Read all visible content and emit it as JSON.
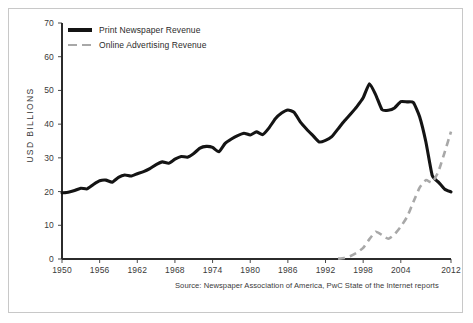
{
  "chart_data": {
    "type": "line",
    "title": "",
    "subtitle": "",
    "xlabel": "",
    "ylabel": "USD BILLIONS",
    "xlim": [
      1950,
      2012
    ],
    "ylim": [
      0,
      70
    ],
    "grid": false,
    "legend_position": "top-left",
    "source": "Source: Newspaper Association of America, PwC State of the Internet reports",
    "xticks": [
      "1950",
      "1956",
      "1962",
      "1968",
      "1974",
      "1980",
      "1986",
      "1992",
      "1998",
      "2004",
      "2012"
    ],
    "xtick_values": [
      1950,
      1956,
      1962,
      1968,
      1974,
      1980,
      1986,
      1992,
      1998,
      2004,
      2012
    ],
    "yticks": [
      "0",
      "10",
      "20",
      "30",
      "40",
      "50",
      "60",
      "70"
    ],
    "ytick_values": [
      0,
      10,
      20,
      30,
      40,
      50,
      60,
      70
    ],
    "series": [
      {
        "name": "Print Newspaper Revenue",
        "color": "#141414",
        "style": "solid",
        "width": 3.1,
        "x": [
          1950,
          1951,
          1952,
          1953,
          1954,
          1955,
          1956,
          1957,
          1958,
          1959,
          1960,
          1961,
          1962,
          1963,
          1964,
          1965,
          1966,
          1967,
          1968,
          1969,
          1970,
          1971,
          1972,
          1973,
          1974,
          1975,
          1976,
          1977,
          1978,
          1979,
          1980,
          1981,
          1982,
          1983,
          1984,
          1985,
          1986,
          1987,
          1988,
          1989,
          1990,
          1991,
          1992,
          1993,
          1994,
          1995,
          1996,
          1997,
          1998,
          1999,
          2000,
          2001,
          2002,
          2003,
          2004,
          2005,
          2006,
          2007,
          2008,
          2009,
          2010,
          2011,
          2012
        ],
        "y": [
          19.6,
          19.8,
          20.3,
          21.0,
          20.8,
          22.1,
          23.2,
          23.4,
          22.8,
          24.2,
          24.9,
          24.6,
          25.3,
          25.9,
          26.8,
          28.0,
          28.8,
          28.4,
          29.6,
          30.4,
          30.2,
          31.3,
          32.9,
          33.4,
          33.1,
          31.8,
          34.3,
          35.6,
          36.6,
          37.3,
          36.8,
          37.7,
          36.9,
          38.9,
          41.6,
          43.3,
          44.2,
          43.5,
          40.6,
          38.5,
          36.6,
          34.7,
          35.2,
          36.3,
          38.6,
          40.9,
          43.0,
          45.2,
          47.8,
          52.0,
          48.7,
          44.3,
          44.1,
          44.8,
          46.7,
          46.6,
          46.4,
          42.2,
          34.7,
          24.8,
          22.8,
          20.7,
          19.9
        ],
        "notes": "Rises from about 20 in 1950 to a peak near 65 around 2000, with an intermediate peak near 60 in 1989-1990, a dip in the early 1990s, then a steep collapse after 2005 down to about 20 by 2012."
      },
      {
        "name": "Online Advertising Revenue",
        "color": "#a8a8a8",
        "style": "dashed",
        "width": 2.6,
        "x": [
          1994,
          1995,
          1996,
          1997,
          1998,
          1999,
          2000,
          2001,
          2002,
          2003,
          2004,
          2005,
          2006,
          2007,
          2008,
          2009,
          2010,
          2011,
          2012
        ],
        "y": [
          0.1,
          0.3,
          0.9,
          1.9,
          3.3,
          5.9,
          8.1,
          7.1,
          6.0,
          7.3,
          9.6,
          12.5,
          16.9,
          21.2,
          23.4,
          22.7,
          26.0,
          31.7,
          37.8
        ],
        "notes": "Near zero until the mid 1990s, rises to a small bump around 2000, dips in 2001-2002, then climbs steadily, crossing the print line around 2010 and reaching about 38 by 2012."
      }
    ]
  },
  "legend": {
    "items": [
      {
        "label": "Print Newspaper Revenue",
        "style": "solid",
        "color": "#141414"
      },
      {
        "label": "Online Advertising Revenue",
        "style": "dashed",
        "color": "#a8a8a8"
      }
    ]
  },
  "axes": {
    "y_axis_title": "USD BILLIONS"
  },
  "footer": {
    "source": "Source: Newspaper Association of America, PwC State of the Internet reports"
  }
}
